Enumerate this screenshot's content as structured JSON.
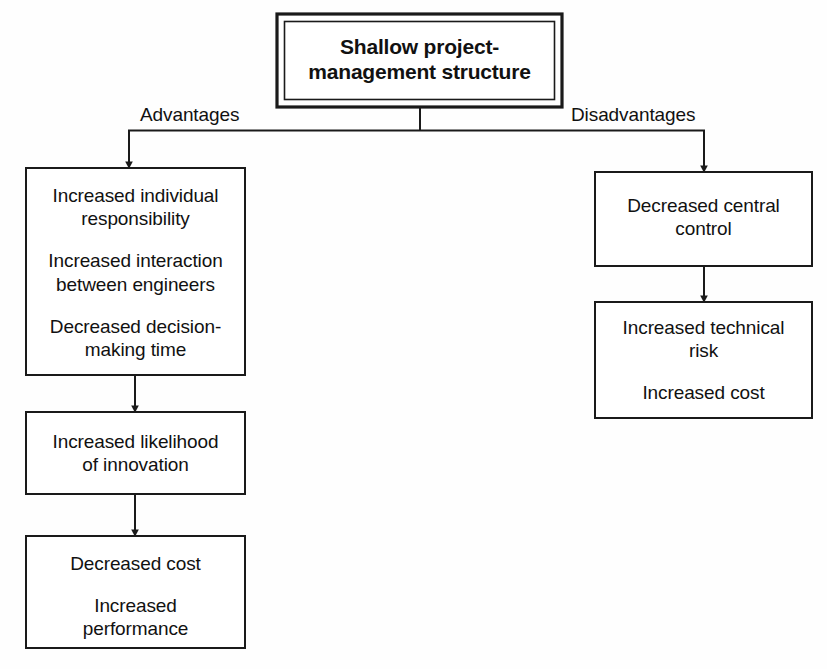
{
  "diagram": {
    "title_node": {
      "label": "Shallow project-\nmanagement structure",
      "line1": "Shallow project-",
      "line2": "management structure"
    },
    "branches": {
      "left_label": "Advantages",
      "right_label": "Disadvantages"
    },
    "advantages_nodes": [
      {
        "name": "advantages-box-1",
        "paragraphs": [
          "Increased individual\nresponsibility",
          "Increased interaction\nbetween engineers",
          "Decreased decision-\nmaking time"
        ]
      },
      {
        "name": "advantages-box-2",
        "paragraphs": [
          "Increased likelihood\nof innovation"
        ]
      },
      {
        "name": "advantages-box-3",
        "paragraphs": [
          "Decreased cost",
          "Increased\nperformance"
        ]
      }
    ],
    "disadvantages_nodes": [
      {
        "name": "disadvantages-box-1",
        "paragraphs": [
          "Decreased central\ncontrol"
        ]
      },
      {
        "name": "disadvantages-box-2",
        "paragraphs": [
          "Increased technical\nrisk",
          "Increased cost"
        ]
      }
    ],
    "colors": {
      "stroke": "#1a1a1a",
      "text": "#111111",
      "background": "#fefefe"
    }
  }
}
